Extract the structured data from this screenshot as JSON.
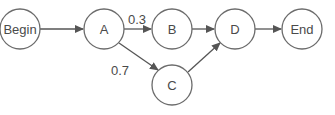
{
  "diagram": {
    "nodes": [
      {
        "id": "begin",
        "label": "Begin"
      },
      {
        "id": "a",
        "label": "A"
      },
      {
        "id": "b",
        "label": "B"
      },
      {
        "id": "c",
        "label": "C"
      },
      {
        "id": "d",
        "label": "D"
      },
      {
        "id": "end",
        "label": "End"
      }
    ],
    "edges": [
      {
        "from": "Begin",
        "to": "A",
        "label": ""
      },
      {
        "from": "A",
        "to": "B",
        "label": "0.3"
      },
      {
        "from": "A",
        "to": "C",
        "label": "0.7"
      },
      {
        "from": "B",
        "to": "D",
        "label": ""
      },
      {
        "from": "C",
        "to": "D",
        "label": ""
      },
      {
        "from": "D",
        "to": "End",
        "label": ""
      }
    ],
    "colors": {
      "stroke": "#6b6b6b",
      "text": "#4a4a4a"
    }
  }
}
